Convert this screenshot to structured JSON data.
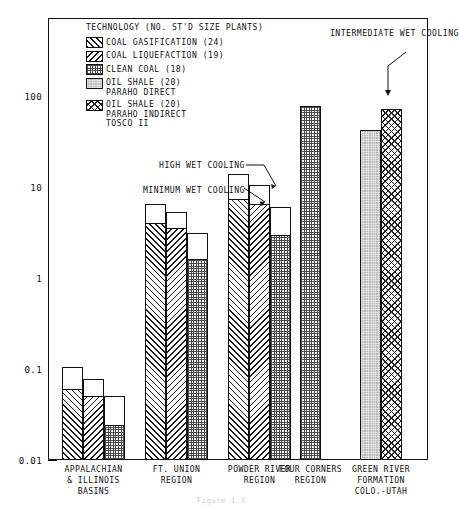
{
  "chart_data": {
    "type": "bar",
    "title": "",
    "xlabel": "",
    "ylabel": "CONSUMPTION OF AVAILABLE SURFACE WATER, PERCENT",
    "yscale": "log",
    "ylim": [
      0.01,
      300
    ],
    "ytick_labels": [
      "0.01",
      "0.1",
      "1",
      "10",
      "100"
    ],
    "ytick_values": [
      0.01,
      0.1,
      1,
      10,
      100
    ],
    "grid": false,
    "legend_position": "upper-left-inside",
    "legend_title": "TECHNOLOGY (NO. ST'D SIZE PLANTS)",
    "categories": [
      "APPALACHIAN & ILLINOIS BASINS",
      "FT. UNION REGION",
      "POWDER RIVER REGION",
      "FOUR CORNERS REGION",
      "GREEN RIVER FORMATION COLO.-UTAH"
    ],
    "series": [
      {
        "name": "COAL GASIFICATION (24)",
        "plants": 24,
        "fill": "diagonal-hatch-right",
        "minimum_wet_cooling": [
          0.06,
          4.0,
          7.3,
          null,
          null
        ],
        "high_wet_cooling": [
          0.105,
          6.5,
          14.0,
          null,
          null
        ]
      },
      {
        "name": "COAL LIQUEFACTION (19)",
        "plants": 19,
        "fill": "diagonal-hatch-left",
        "minimum_wet_cooling": [
          0.05,
          3.5,
          6.5,
          null,
          null
        ],
        "high_wet_cooling": [
          0.078,
          5.3,
          10.5,
          null,
          null
        ]
      },
      {
        "name": "CLEAN COAL (18)",
        "plants": 18,
        "fill": "fine-dot-grid",
        "minimum_wet_cooling": [
          0.024,
          1.6,
          3.0,
          78.0,
          null
        ],
        "high_wet_cooling": [
          0.05,
          3.1,
          6.0,
          78.0,
          null
        ]
      },
      {
        "name": "OIL SHALE (20) PARAHO DIRECT",
        "plants": 20,
        "fill": "solid-grey",
        "intermediate_wet_cooling": [
          null,
          null,
          null,
          null,
          42.0
        ]
      },
      {
        "name": "OIL SHALE (20) PARAHO INDIRECT TOSCO II",
        "plants": 20,
        "fill": "cross-hatch",
        "intermediate_wet_cooling": [
          null,
          null,
          null,
          null,
          72.0
        ]
      }
    ],
    "annotations": [
      {
        "text": "HIGH WET COOLING",
        "points_to": "top of open bar extension"
      },
      {
        "text": "MINIMUM WET COOLING",
        "points_to": "top of hatched bar section"
      },
      {
        "text": "INTERMEDIATE WET COOLING",
        "points_to": "Green River Paraho Direct bar top"
      }
    ]
  },
  "legend": {
    "title": "TECHNOLOGY (NO. ST'D SIZE PLANTS)",
    "items": [
      {
        "line1": "COAL GASIFICATION (24)",
        "line2": "",
        "line3": ""
      },
      {
        "line1": "COAL LIQUEFACTION (19)",
        "line2": "",
        "line3": ""
      },
      {
        "line1": "CLEAN COAL (18)",
        "line2": "",
        "line3": ""
      },
      {
        "line1": "OIL SHALE (20)",
        "line2": "PARAHO DIRECT",
        "line3": ""
      },
      {
        "line1": "OIL SHALE (20)",
        "line2": "PARAHO INDIRECT",
        "line3": "TOSCO II"
      }
    ]
  },
  "axes": {
    "y_title": "CONSUMPTION OF AVAILABLE SURFACE WATER, PERCENT",
    "y_labels": [
      "100",
      "10",
      "1",
      "0.1",
      "0.01"
    ]
  },
  "annotations": {
    "high_wet": {
      "line1": "HIGH WET",
      "line2": "COOLING"
    },
    "min_wet": {
      "line1": "MINIMUM",
      "line2": "WET COOLING"
    },
    "intermediate": {
      "line1": "INTERMEDIATE",
      "line2": "WET COOLING"
    }
  },
  "xlabels": [
    {
      "l1": "APPALACHIAN",
      "l2": "& ILLINOIS",
      "l3": "BASINS"
    },
    {
      "l1": "FT. UNION",
      "l2": "REGION",
      "l3": ""
    },
    {
      "l1": "POWDER RIVER",
      "l2": "REGION",
      "l3": ""
    },
    {
      "l1": "FOUR CORNERS",
      "l2": "REGION",
      "l3": ""
    },
    {
      "l1": "GREEN RIVER",
      "l2": "FORMATION",
      "l3": "COLO.-UTAH"
    }
  ],
  "caption": "Figure 1.3",
  "colors": {
    "ink": "#111111",
    "paper": "#ffffff",
    "grey_fill": "#b9b9b9"
  }
}
